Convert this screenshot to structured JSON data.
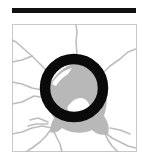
{
  "figure": {
    "title": "Optic disc with ring overlay",
    "colors": {
      "bar": "#111111",
      "frame": "#c8c8c8",
      "vessel": "#bdbdbd",
      "disc": "#b8b8b8",
      "ring": "#0a0a0a",
      "background": "#ffffff",
      "cup": "#ffffff"
    }
  }
}
